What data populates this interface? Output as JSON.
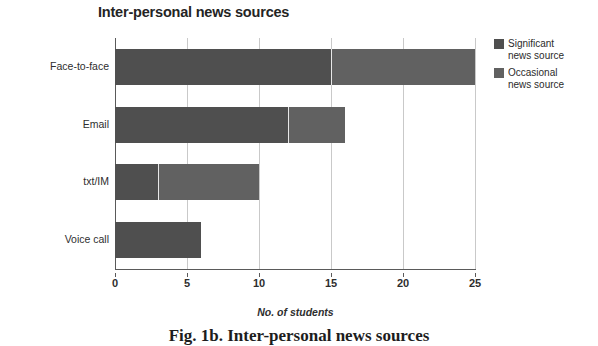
{
  "chart_data": {
    "type": "bar",
    "orientation": "horizontal",
    "stacked": true,
    "title": "Inter-personal news sources",
    "xlabel": "No. of students",
    "ylabel": "",
    "categories": [
      "Face-to-face",
      "Email",
      "txt/IM",
      "Voice call"
    ],
    "series": [
      {
        "name": "Significant news source",
        "values": [
          15,
          12,
          3,
          6
        ],
        "color": "#4f4f4f"
      },
      {
        "name": "Occasional news source",
        "values": [
          10,
          4,
          7,
          0
        ],
        "color": "#616161"
      }
    ],
    "totals": [
      25,
      16,
      10,
      6
    ],
    "xlim": [
      0,
      25
    ],
    "xticks": [
      0,
      5,
      10,
      15,
      20,
      25
    ],
    "xtick_labels": [
      "0",
      "5",
      "10",
      "15",
      "20",
      "25"
    ],
    "grid": "vertical",
    "legend_position": "right-top"
  },
  "legend": {
    "entries": [
      {
        "label": "Significant\nnews source",
        "swatch": "sig"
      },
      {
        "label": "Occasional\nnews source",
        "swatch": "occ"
      }
    ]
  },
  "caption": {
    "text": "Fig. 1b. Inter-personal news sources"
  },
  "colors": {
    "significant": "#4f4f4f",
    "occasional": "#616161",
    "gridline": "#c9c9c9",
    "axis": "#5a5a5a",
    "background": "#ffffff"
  }
}
